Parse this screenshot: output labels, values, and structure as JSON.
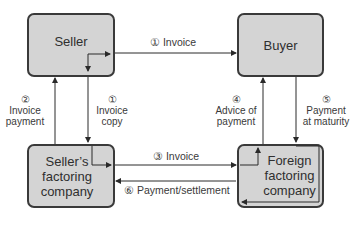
{
  "nodes": {
    "seller": "Seller",
    "buyer": "Buyer",
    "sellers_factoring": [
      "Seller’s",
      "factoring",
      "company"
    ],
    "foreign_factoring": [
      "Foreign",
      "factoring",
      "company"
    ]
  },
  "edges": [
    {
      "step": "①",
      "label": "Invoice",
      "from": "Seller",
      "to": "Buyer"
    },
    {
      "step": "①",
      "label": [
        "Invoice",
        "copy"
      ],
      "from": "Seller",
      "to": "Seller's factoring company"
    },
    {
      "step": "②",
      "label": [
        "Invoice",
        "payment"
      ],
      "from": "Seller's factoring company",
      "to": "Seller"
    },
    {
      "step": "③",
      "label": "Invoice",
      "from": "Seller's factoring company",
      "to": "Foreign factoring company"
    },
    {
      "step": "④",
      "label": [
        "Advice of",
        "payment"
      ],
      "from": "Foreign factoring company",
      "to": "Buyer"
    },
    {
      "step": "⑤",
      "label": [
        "Payment",
        "at maturity"
      ],
      "from": "Buyer",
      "to": "Foreign factoring company"
    },
    {
      "step": "⑥",
      "label": "Payment/settlement",
      "from": "Foreign factoring company",
      "to": "Seller's factoring company"
    }
  ],
  "labels": {
    "e1_top": "① Invoice",
    "e1_copy_num": "①",
    "e1_copy_l1": "Invoice",
    "e1_copy_l2": "copy",
    "e2_num": "②",
    "e2_l1": "Invoice",
    "e2_l2": "payment",
    "e3": "③ Invoice",
    "e4_num": "④",
    "e4_l1": "Advice of",
    "e4_l2": "payment",
    "e5_num": "⑤",
    "e5_l1": "Payment",
    "e5_l2": "at maturity",
    "e6": "⑥ Payment/settlement"
  },
  "colors": {
    "box_fill": "#d4d4d4",
    "stroke": "#3a3a3a",
    "text": "#333333"
  }
}
